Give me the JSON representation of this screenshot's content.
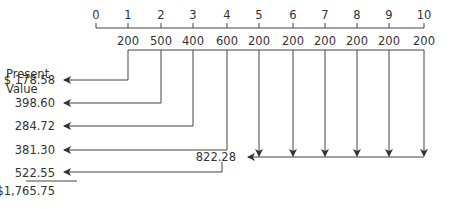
{
  "diagram": {
    "timeline_labels": [
      "0",
      "1",
      "2",
      "3",
      "4",
      "5",
      "6",
      "7",
      "8",
      "9",
      "10"
    ],
    "cash_flows": [
      "200",
      "500",
      "400",
      "600",
      "200",
      "200",
      "200",
      "200",
      "200",
      "200"
    ],
    "present_value_header_line1": "Present",
    "present_value_header_line2": "Value",
    "present_values": [
      "$ 178.58",
      "398.60",
      "284.72",
      "381.30",
      "522.55"
    ],
    "annuity_value": "822.28",
    "total": "$1,765.75"
  }
}
